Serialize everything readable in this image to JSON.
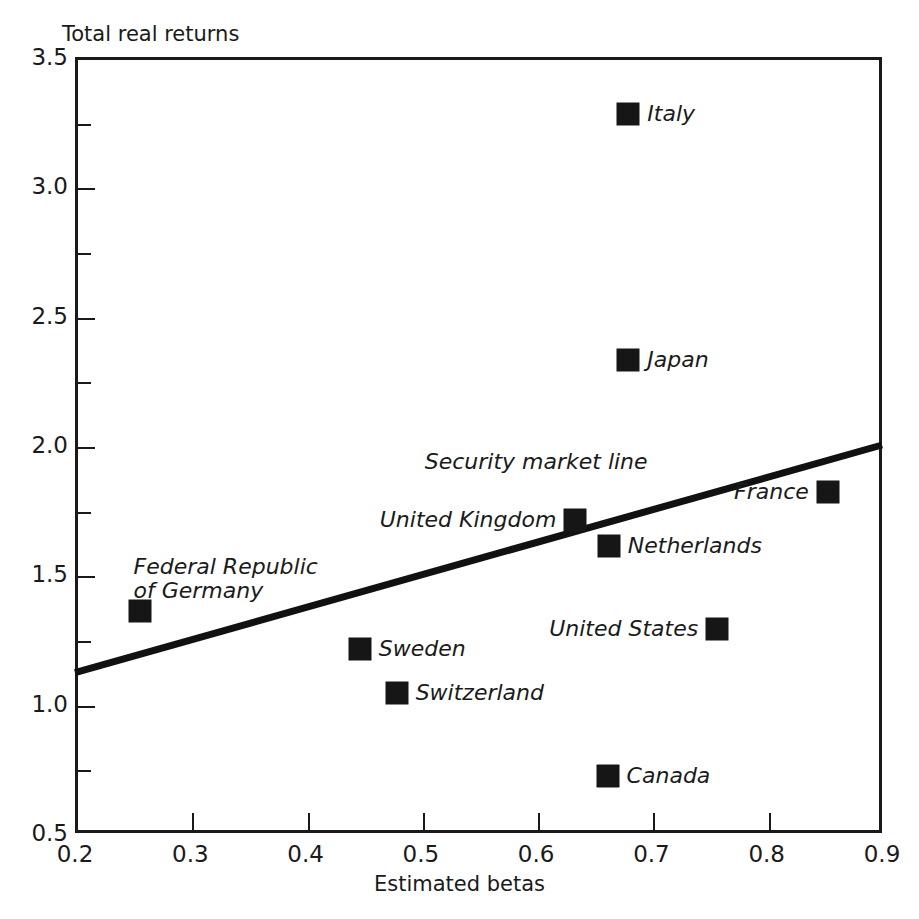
{
  "chart_data": {
    "type": "scatter",
    "title": "",
    "xlabel": "Estimated betas",
    "ylabel": "Total real returns",
    "xlim": [
      0.2,
      0.9
    ],
    "ylim": [
      0.5,
      3.5
    ],
    "grid": false,
    "legend": "none",
    "x_ticks": [
      "0.2",
      "0.3",
      "0.4",
      "0.5",
      "0.6",
      "0.7",
      "0.8",
      "0.9"
    ],
    "x_tick_values": [
      0.2,
      0.3,
      0.4,
      0.5,
      0.6,
      0.7,
      0.8,
      0.9
    ],
    "y_ticks": [
      "0.5",
      "1.0",
      "1.5",
      "2.0",
      "2.5",
      "3.0",
      "3.5"
    ],
    "y_tick_values": [
      0.5,
      1.0,
      1.5,
      2.0,
      2.5,
      3.0,
      3.5
    ],
    "y_minor_tick_values": [
      0.75,
      1.25,
      1.75,
      2.25,
      2.75,
      3.25
    ],
    "points": [
      {
        "label": "Italy",
        "x": 0.68,
        "y": 3.28,
        "label_side": "right"
      },
      {
        "label": "Japan",
        "x": 0.68,
        "y": 2.33,
        "label_side": "right"
      },
      {
        "label": "France",
        "x": 0.853,
        "y": 1.82,
        "label_side": "left"
      },
      {
        "label": "United Kingdom",
        "x": 0.634,
        "y": 1.71,
        "label_side": "left"
      },
      {
        "label": "Netherlands",
        "x": 0.663,
        "y": 1.61,
        "label_side": "right"
      },
      {
        "label": "Federal Republic\nof Germany",
        "x": 0.256,
        "y": 1.36,
        "label_side": "above"
      },
      {
        "label": "United States",
        "x": 0.757,
        "y": 1.29,
        "label_side": "left"
      },
      {
        "label": "Sweden",
        "x": 0.447,
        "y": 1.21,
        "label_side": "right"
      },
      {
        "label": "Switzerland",
        "x": 0.479,
        "y": 1.04,
        "label_side": "right"
      },
      {
        "label": "Canada",
        "x": 0.662,
        "y": 0.72,
        "label_side": "right"
      }
    ],
    "annotations": [
      {
        "name": "security-market-line",
        "text": "Security market line",
        "type": "line",
        "x0": 0.2,
        "y0": 1.12,
        "x1": 0.9,
        "y1": 2.0,
        "label_x": 0.6,
        "label_y": 1.93
      }
    ],
    "colors": {
      "marker": "#161616",
      "axis": "#1a1a1a",
      "line": "#111111",
      "background": "#ffffff"
    }
  }
}
